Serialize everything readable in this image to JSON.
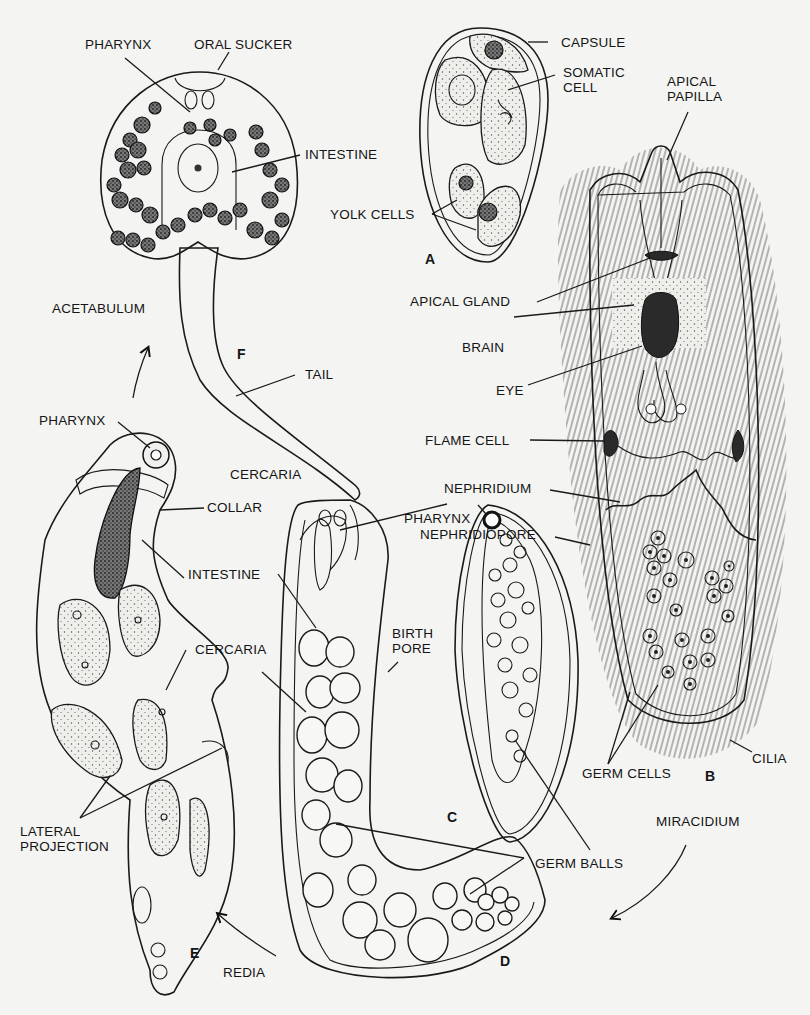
{
  "figure": {
    "panels": [
      {
        "id": "A",
        "letter": "A",
        "stage": "Egg",
        "labels": [
          "CAPSULE",
          "SOMATIC CELL",
          "YOLK CELLS"
        ]
      },
      {
        "id": "B",
        "letter": "B",
        "stage": "MIRACIDIUM",
        "labels": [
          "APICAL PAPILLA",
          "APICAL GLAND",
          "BRAIN",
          "EYE",
          "FLAME CELL",
          "NEPHRIDIUM",
          "NEPHRIDIOPORE",
          "GERM CELLS",
          "CILIA"
        ]
      },
      {
        "id": "C",
        "letter": "C",
        "stage": "Sporocyst",
        "labels": [
          "PHARYNX",
          "GERM BALLS"
        ]
      },
      {
        "id": "D",
        "letter": "D",
        "stage": "Redia (germ balls)",
        "labels": [
          "INTESTINE",
          "PHARYNX",
          "BIRTH PORE",
          "CERCARIA",
          "GERM BALLS"
        ]
      },
      {
        "id": "E",
        "letter": "E",
        "stage": "REDIA",
        "labels": [
          "PHARYNX",
          "COLLAR",
          "INTESTINE",
          "CERCARIA",
          "LATERAL PROJECTION"
        ]
      },
      {
        "id": "F",
        "letter": "F",
        "stage": "CERCARIA",
        "labels": [
          "PHARYNX",
          "ORAL SUCKER",
          "INTESTINE",
          "ACETABULUM",
          "TAIL"
        ]
      }
    ]
  },
  "labels": {
    "f_pharynx": "PHARYNX",
    "f_oral_sucker": "ORAL SUCKER",
    "f_intestine": "INTESTINE",
    "f_acetabulum": "ACETABULUM",
    "f_tail": "TAIL",
    "f_letter": "F",
    "cercaria_stage": "CERCARIA",
    "a_capsule": "CAPSULE",
    "a_somatic_cell": "SOMATIC\nCELL",
    "a_yolk_cells": "YOLK CELLS",
    "a_letter": "A",
    "b_apical_papilla": "APICAL\nPAPILLA",
    "b_apical_gland": "APICAL GLAND",
    "b_brain": "BRAIN",
    "b_eye": "EYE",
    "b_flame_cell": "FLAME  CELL",
    "b_nephridium": "NEPHRIDIUM",
    "b_nephridiopore": "NEPHRIDIOPORE",
    "b_germ_cells": "GERM CELLS",
    "b_cilia": "CILIA",
    "b_letter": "B",
    "miracidium_stage": "MIRACIDIUM",
    "c_pharynx": "PHARYNX",
    "c_letter": "C",
    "germ_balls": "GERM BALLS",
    "d_intestine": "INTESTINE",
    "d_birth_pore": "BIRTH\nPORE",
    "d_cercaria": "CERCARIA",
    "d_letter": "D",
    "e_pharynx": "PHARYNX",
    "e_collar": "COLLAR",
    "e_lateral_projection": "LATERAL\nPROJECTION",
    "e_letter": "E",
    "redia_stage": "REDIA"
  },
  "arrows": [
    {
      "from": "MIRACIDIUM",
      "direction": "down-left"
    },
    {
      "from": "REDIA",
      "direction": "up-left"
    },
    {
      "from": "E",
      "to": "F",
      "direction": "up"
    }
  ]
}
